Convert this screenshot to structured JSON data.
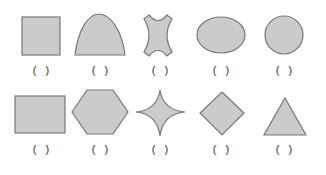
{
  "worksheet": {
    "fill_color": "#cbcbcb",
    "stroke_color": "#777777",
    "answer_blank": "(   )",
    "rows": [
      {
        "items": [
          {
            "shape": "square",
            "label": "(   )"
          },
          {
            "shape": "arch",
            "label": "(   )"
          },
          {
            "shape": "concave-four-point",
            "label": "(   )"
          },
          {
            "shape": "ellipse",
            "label": "(   )"
          },
          {
            "shape": "circle",
            "label": "(   )"
          }
        ]
      },
      {
        "items": [
          {
            "shape": "rectangle",
            "label": "(   )"
          },
          {
            "shape": "hexagon",
            "label": "(   )"
          },
          {
            "shape": "four-point-star",
            "label": "(   )"
          },
          {
            "shape": "diamond",
            "label": "(   )"
          },
          {
            "shape": "triangle",
            "label": "(   )"
          }
        ]
      }
    ]
  }
}
